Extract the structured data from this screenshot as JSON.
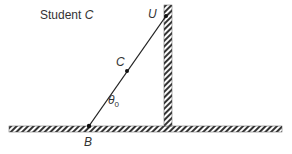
{
  "diagram": {
    "title": "Student C",
    "title_prefix": "Student ",
    "title_var": "C",
    "points": {
      "U": {
        "label": "U",
        "x": 166,
        "y": 16
      },
      "C": {
        "label": "C",
        "x": 127,
        "y": 71
      },
      "B": {
        "label": "B",
        "x": 89,
        "y": 126
      }
    },
    "angle": {
      "symbol": "θ",
      "subscript": "0"
    },
    "floor": {
      "x1": 9,
      "x2": 282,
      "y": 126,
      "thickness": 6
    },
    "wall": {
      "x": 164,
      "y1": 5,
      "y2": 126,
      "thickness": 8
    },
    "colors": {
      "line": "#222222",
      "hatch": "#333333",
      "background": "#ffffff"
    }
  }
}
